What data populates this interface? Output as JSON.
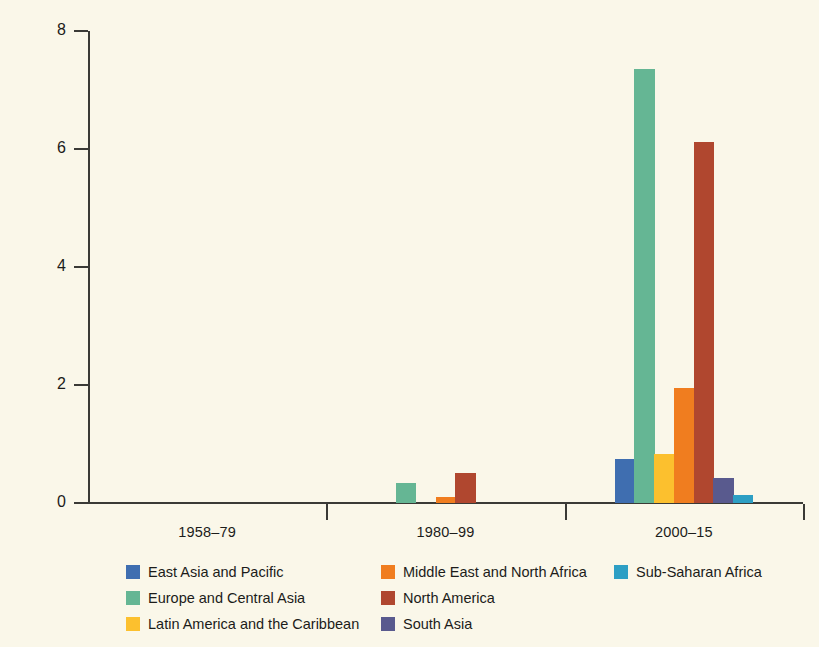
{
  "chart_data": {
    "type": "bar",
    "title": "",
    "subtitle": "",
    "xlabel": "",
    "ylabel": "",
    "categories": [
      "1958–79",
      "1980–99",
      "2000–15"
    ],
    "ylim": [
      0,
      8
    ],
    "yticks": [
      0,
      2,
      4,
      6,
      8
    ],
    "ytick_labels": [
      "0",
      "2",
      "4",
      "6",
      "8"
    ],
    "grid": false,
    "legend_position": "bottom",
    "background_color": "#faf7e9",
    "axis_color": "#3a3a36",
    "series": [
      {
        "name": "East Asia and Pacific",
        "color": "#3f6eb0",
        "values": [
          0,
          0,
          0.75
        ]
      },
      {
        "name": "Europe and Central Asia",
        "color": "#65b694",
        "values": [
          0,
          0.34,
          7.35
        ]
      },
      {
        "name": "Latin America and the Caribbean",
        "color": "#fcc02e",
        "values": [
          0,
          0,
          0.83
        ]
      },
      {
        "name": "Middle East and North Africa",
        "color": "#f07d1f",
        "values": [
          0,
          0.11,
          1.95
        ]
      },
      {
        "name": "North America",
        "color": "#b0472f",
        "values": [
          0,
          0.51,
          6.12
        ]
      },
      {
        "name": "South Asia",
        "color": "#595a8e",
        "values": [
          0,
          0,
          0.42
        ]
      },
      {
        "name": "Sub-Saharan Africa",
        "color": "#2d9fc4",
        "values": [
          0,
          0,
          0.13
        ]
      }
    ]
  },
  "legend": {
    "columns": [
      [
        "East Asia and Pacific",
        "Europe and Central Asia",
        "Latin America and the Caribbean"
      ],
      [
        "Middle East and North Africa",
        "North America",
        "South Asia"
      ],
      [
        "Sub-Saharan Africa"
      ]
    ]
  }
}
